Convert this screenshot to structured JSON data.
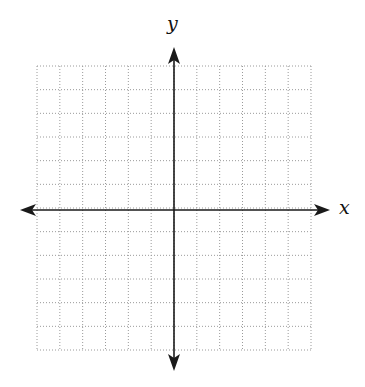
{
  "diagram": {
    "type": "coordinate-plane",
    "x_axis_label": "x",
    "y_axis_label": "y",
    "grid": {
      "columns": 12,
      "rows": 12,
      "cells_each_side": 6,
      "style": "dotted"
    },
    "colors": {
      "axis": "#1a1a1a",
      "grid": "#9a9a9a",
      "background": "#ffffff"
    }
  }
}
